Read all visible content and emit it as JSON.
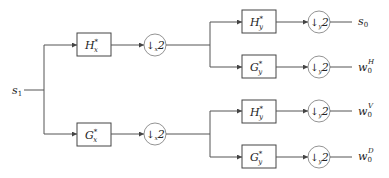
{
  "diagram": {
    "type": "2D separable wavelet analysis filter bank",
    "input": {
      "label": "s",
      "sub": "1"
    },
    "stage1": [
      {
        "filter": {
          "base": "H",
          "sup": "*",
          "sub": "x"
        },
        "down": {
          "arrow": "↓",
          "sub": "x",
          "factor": "2"
        }
      },
      {
        "filter": {
          "base": "G",
          "sup": "*",
          "sub": "x"
        },
        "down": {
          "arrow": "↓",
          "sub": "x",
          "factor": "2"
        }
      }
    ],
    "stage2": [
      {
        "filter": {
          "base": "H",
          "sup": "*",
          "sub": "y"
        },
        "down": {
          "arrow": "↓",
          "sub": "y",
          "factor": "2"
        },
        "output": {
          "base": "s",
          "sub": "0",
          "sup": ""
        }
      },
      {
        "filter": {
          "base": "G",
          "sup": "*",
          "sub": "y"
        },
        "down": {
          "arrow": "↓",
          "sub": "y",
          "factor": "2"
        },
        "output": {
          "base": "w",
          "sub": "0",
          "sup": "H"
        }
      },
      {
        "filter": {
          "base": "H",
          "sup": "*",
          "sub": "y"
        },
        "down": {
          "arrow": "↓",
          "sub": "y",
          "factor": "2"
        },
        "output": {
          "base": "w",
          "sub": "0",
          "sup": "V"
        }
      },
      {
        "filter": {
          "base": "G",
          "sup": "*",
          "sub": "y"
        },
        "down": {
          "arrow": "↓",
          "sub": "y",
          "factor": "2"
        },
        "output": {
          "base": "w",
          "sub": "0",
          "sup": "D"
        }
      }
    ]
  }
}
